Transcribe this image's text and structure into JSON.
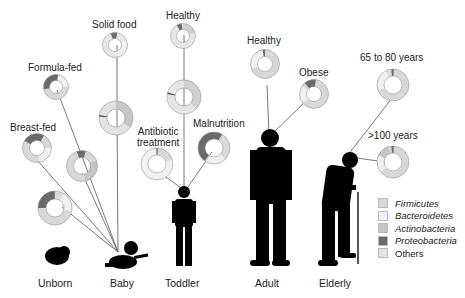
{
  "colors": {
    "firmicutes": "#d8d8d8",
    "bacteroidetes": "#f1f1f1",
    "actinobacteria": "#c6c6c6",
    "proteobacteria": "#6a6a6a",
    "others": "#e2e2e2",
    "line": "#555555",
    "silhouette": "#000000"
  },
  "stages": [
    {
      "label": "Unborn"
    },
    {
      "label": "Baby"
    },
    {
      "label": "Toddler"
    },
    {
      "label": "Adult"
    },
    {
      "label": "Elderly"
    }
  ],
  "donut_labels": {
    "breast_fed": "Breast-fed",
    "formula_fed": "Formula-fed",
    "solid_food": "Solid food",
    "toddler_healthy": "Healthy",
    "antibiotic": "Antibiotic treatment",
    "antibiotic_l1": "Antibiotic",
    "antibiotic_l2": "treatment",
    "malnutrition": "Malnutrition",
    "adult_healthy": "Healthy",
    "obese": "Obese",
    "elderly_65_80": "65 to 80 years",
    "elderly_100": ">100 years"
  },
  "legend": [
    {
      "label": "Firmicutes",
      "italic": true,
      "color": "#d8d8d8"
    },
    {
      "label": "Bacteroidetes",
      "italic": true,
      "color": "#f1f1f1"
    },
    {
      "label": "Actinobacteria",
      "italic": true,
      "color": "#c6c6c6"
    },
    {
      "label": "Proteobacteria",
      "italic": true,
      "color": "#6a6a6a"
    },
    {
      "label": "Others",
      "italic": false,
      "color": "#e2e2e2"
    }
  ]
}
